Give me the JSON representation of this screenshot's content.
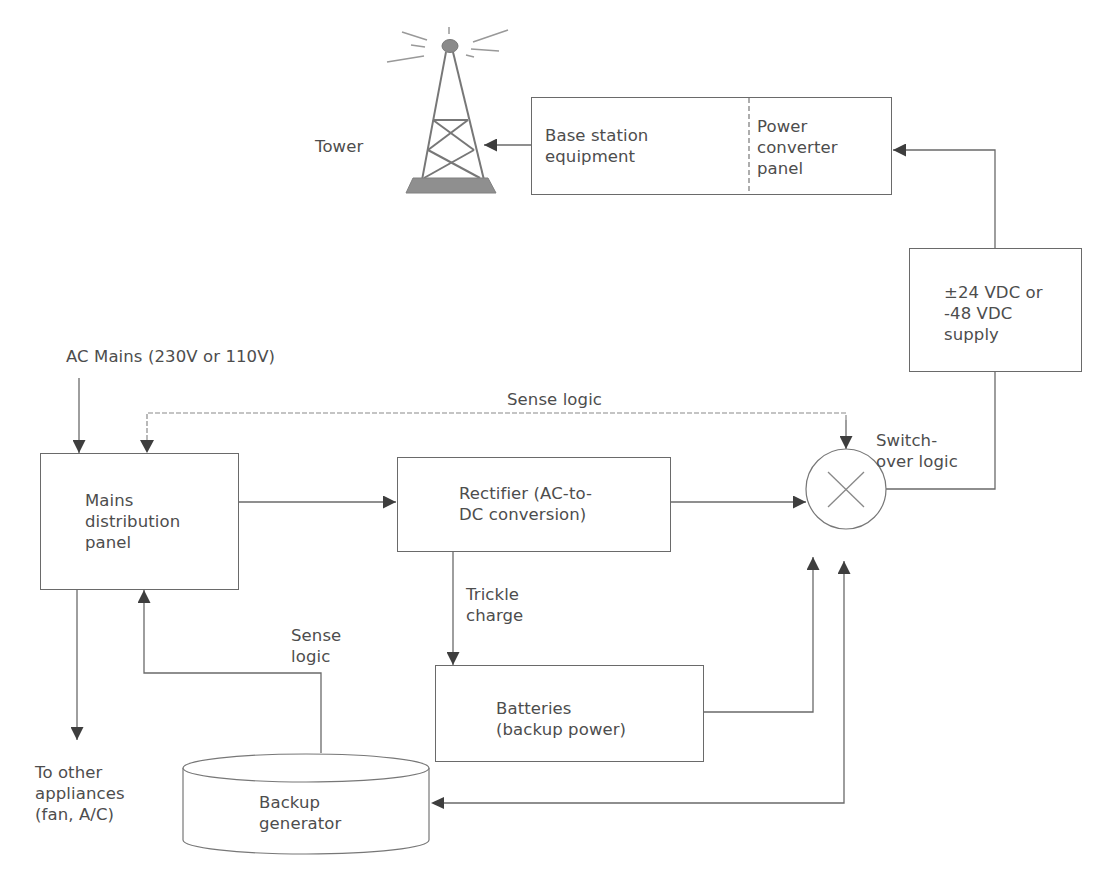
{
  "colors": {
    "line": "#6a6a6a",
    "arrow": "#3e3e3e",
    "text": "#4d4d4d",
    "background": "#ffffff",
    "tower_base": "#888888"
  },
  "nodes": {
    "tower": {
      "label": "Tower",
      "icon": "radio-tower-icon"
    },
    "base_station": {
      "left_label": [
        "Base station",
        "equipment"
      ],
      "right_label": [
        "Power",
        "converter",
        "panel"
      ]
    },
    "dc_supply": {
      "label": [
        "±24 VDC or",
        "-48 VDC",
        "supply"
      ]
    },
    "ac_mains": {
      "label": "AC Mains (230V or 110V)"
    },
    "mains_panel": {
      "label": [
        "Mains",
        "distribution",
        "panel"
      ]
    },
    "rectifier": {
      "label": [
        "Rectifier (AC-to-",
        "DC conversion)"
      ]
    },
    "switchover": {
      "label": [
        "Switch-",
        "over logic"
      ],
      "icon": "multiplier-x-icon"
    },
    "batteries": {
      "label": [
        "Batteries",
        "(backup power)"
      ]
    },
    "generator": {
      "label": [
        "Backup",
        "generator"
      ]
    },
    "other_appliances": {
      "label": [
        "To other",
        "appliances",
        "(fan, A/C)"
      ]
    }
  },
  "edge_labels": {
    "sense_logic_top": "Sense logic",
    "sense_logic_generator": [
      "Sense",
      "logic"
    ],
    "trickle_charge": [
      "Trickle",
      "charge"
    ]
  },
  "edges": [
    {
      "from": "base_station",
      "to": "tower"
    },
    {
      "from": "dc_supply",
      "to": "base_station"
    },
    {
      "from": "switchover",
      "to": "dc_supply"
    },
    {
      "from": "ac_mains",
      "to": "mains_panel"
    },
    {
      "from": "switchover",
      "to": "mains_panel",
      "label": "Sense logic",
      "style": "dotted"
    },
    {
      "from": "switchover",
      "to": "switchover",
      "label": "Sense logic"
    },
    {
      "from": "mains_panel",
      "to": "rectifier"
    },
    {
      "from": "rectifier",
      "to": "switchover"
    },
    {
      "from": "rectifier",
      "to": "batteries",
      "label": "Trickle charge"
    },
    {
      "from": "batteries",
      "to": "switchover"
    },
    {
      "from": "generator",
      "to": "switchover"
    },
    {
      "from": "switchover",
      "to": "generator"
    },
    {
      "from": "generator",
      "to": "mains_panel",
      "label": "Sense logic"
    },
    {
      "from": "mains_panel",
      "to": "other_appliances"
    }
  ]
}
